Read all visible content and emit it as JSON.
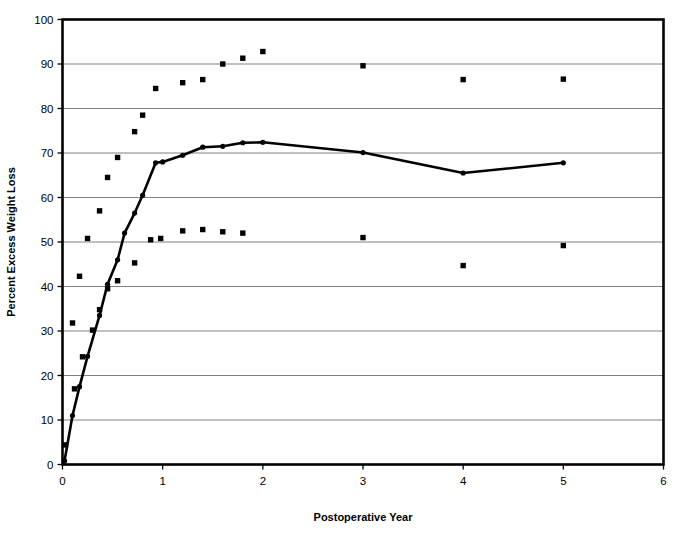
{
  "chart_data": {
    "type": "scatter",
    "title": "",
    "xlabel": "Postoperative Year",
    "ylabel": "Percent Excess Weight Loss",
    "xlim": [
      0,
      6
    ],
    "ylim": [
      0,
      100
    ],
    "xticks": [
      0,
      1,
      2,
      3,
      4,
      5,
      6
    ],
    "yticks": [
      0,
      10,
      20,
      30,
      40,
      50,
      60,
      70,
      80,
      90,
      100
    ],
    "xtick_labels": [
      "0",
      "1",
      "2",
      "3",
      "4",
      "5",
      "6"
    ],
    "ytick_labels": [
      "0",
      "10",
      "20",
      "30",
      "40",
      "50",
      "60",
      "70",
      "80",
      "90",
      "100"
    ],
    "grid": "horizontal",
    "legend": "none",
    "plot_border": true,
    "series": [
      {
        "name": "Mean percent excess weight loss",
        "marker": "circle",
        "line": "solid",
        "color": "#000000",
        "points": [
          {
            "x": 0.02,
            "y": 0.8
          },
          {
            "x": 0.1,
            "y": 11.0
          },
          {
            "x": 0.17,
            "y": 17.5
          },
          {
            "x": 0.25,
            "y": 24.3
          },
          {
            "x": 0.37,
            "y": 33.5
          },
          {
            "x": 0.45,
            "y": 40.5
          },
          {
            "x": 0.55,
            "y": 46.0
          },
          {
            "x": 0.62,
            "y": 52.0
          },
          {
            "x": 0.72,
            "y": 56.5
          },
          {
            "x": 0.8,
            "y": 60.5
          },
          {
            "x": 0.93,
            "y": 67.8
          },
          {
            "x": 1.0,
            "y": 68.0
          },
          {
            "x": 1.2,
            "y": 69.5
          },
          {
            "x": 1.4,
            "y": 71.3
          },
          {
            "x": 1.6,
            "y": 71.5
          },
          {
            "x": 1.8,
            "y": 72.3
          },
          {
            "x": 2.0,
            "y": 72.4
          },
          {
            "x": 3.0,
            "y": 70.1
          },
          {
            "x": 4.0,
            "y": 65.5
          },
          {
            "x": 5.0,
            "y": 67.8
          }
        ]
      },
      {
        "name": "Upper range of percent excess weight loss",
        "marker": "square",
        "line": "none",
        "color": "#000000",
        "points": [
          {
            "x": 0.1,
            "y": 31.8
          },
          {
            "x": 0.17,
            "y": 42.3
          },
          {
            "x": 0.25,
            "y": 50.8
          },
          {
            "x": 0.37,
            "y": 57.0
          },
          {
            "x": 0.45,
            "y": 64.5
          },
          {
            "x": 0.55,
            "y": 69.0
          },
          {
            "x": 0.72,
            "y": 74.8
          },
          {
            "x": 0.8,
            "y": 78.5
          },
          {
            "x": 0.93,
            "y": 84.5
          },
          {
            "x": 1.2,
            "y": 85.8
          },
          {
            "x": 1.4,
            "y": 86.5
          },
          {
            "x": 1.6,
            "y": 90.0
          },
          {
            "x": 1.8,
            "y": 91.3
          },
          {
            "x": 2.0,
            "y": 92.8
          },
          {
            "x": 3.0,
            "y": 89.6
          },
          {
            "x": 4.0,
            "y": 86.5
          },
          {
            "x": 5.0,
            "y": 86.6
          }
        ]
      },
      {
        "name": "Lower range of percent excess weight loss",
        "marker": "square",
        "line": "none",
        "color": "#000000",
        "points": [
          {
            "x": 0.03,
            "y": 4.4
          },
          {
            "x": 0.12,
            "y": 17.0
          },
          {
            "x": 0.2,
            "y": 24.2
          },
          {
            "x": 0.3,
            "y": 30.2
          },
          {
            "x": 0.37,
            "y": 34.8
          },
          {
            "x": 0.45,
            "y": 39.5
          },
          {
            "x": 0.55,
            "y": 41.3
          },
          {
            "x": 0.72,
            "y": 45.3
          },
          {
            "x": 0.88,
            "y": 50.5
          },
          {
            "x": 0.98,
            "y": 50.8
          },
          {
            "x": 1.2,
            "y": 52.5
          },
          {
            "x": 1.4,
            "y": 52.8
          },
          {
            "x": 1.6,
            "y": 52.3
          },
          {
            "x": 1.8,
            "y": 52.0
          },
          {
            "x": 3.0,
            "y": 51.0
          },
          {
            "x": 4.0,
            "y": 44.7
          },
          {
            "x": 5.0,
            "y": 49.2
          }
        ]
      }
    ]
  }
}
